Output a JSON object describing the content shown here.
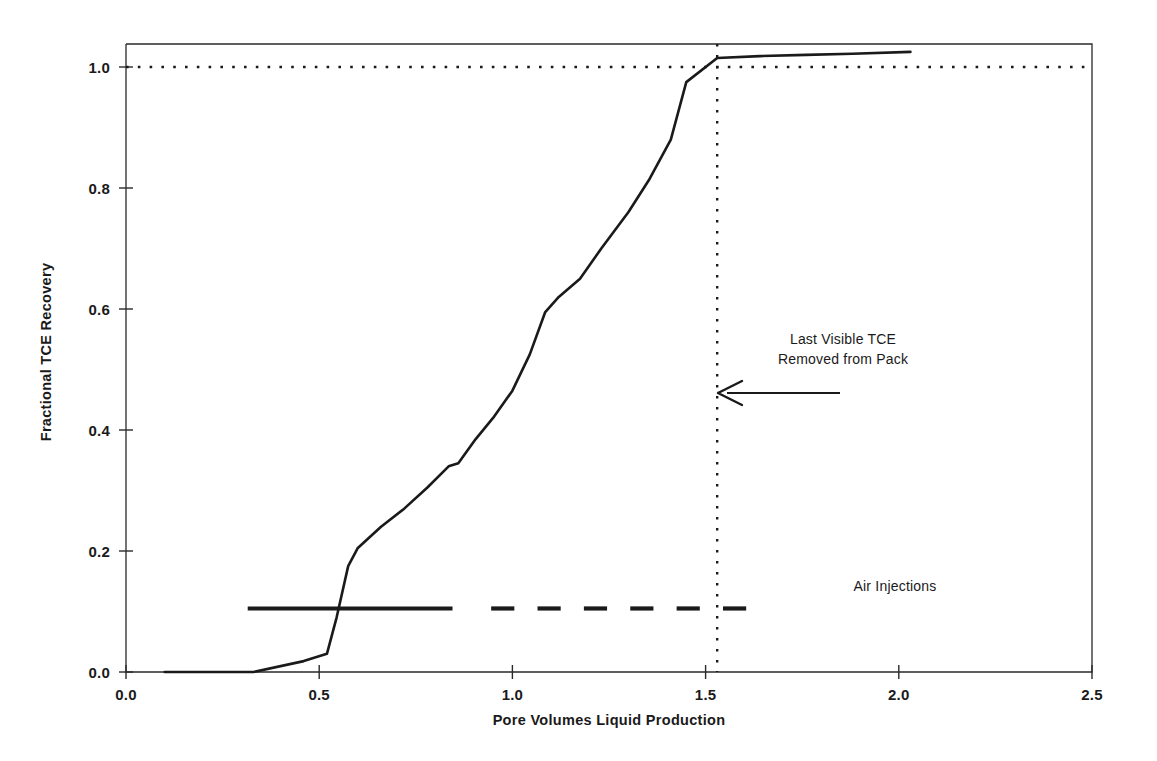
{
  "chart_data": {
    "type": "line",
    "title": "",
    "xlabel": "Pore Volumes Liquid Production",
    "ylabel": "Fractional TCE Recovery",
    "xlim": [
      0.0,
      2.5
    ],
    "ylim": [
      0.0,
      1.05
    ],
    "xticks": [
      "0.0",
      "0.5",
      "1.0",
      "1.5",
      "2.0",
      "2.5"
    ],
    "xtick_values": [
      0.0,
      0.5,
      1.0,
      1.5,
      2.0,
      2.5
    ],
    "yticks": [
      "0.0",
      "0.2",
      "0.4",
      "0.6",
      "0.8",
      "1.0"
    ],
    "ytick_values": [
      0.0,
      0.2,
      0.4,
      0.6,
      0.8,
      1.0
    ],
    "grid": false,
    "legend": "none",
    "series": [
      {
        "name": "Fractional TCE Recovery",
        "style": "solid",
        "x": [
          0.1,
          0.21,
          0.33,
          0.46,
          0.52,
          0.545,
          0.575,
          0.6,
          0.66,
          0.72,
          0.78,
          0.835,
          0.86,
          0.905,
          0.95,
          1.0,
          1.045,
          1.085,
          1.12,
          1.175,
          1.23,
          1.3,
          1.355,
          1.41,
          1.45,
          1.53,
          1.64,
          1.76,
          1.88,
          2.03
        ],
        "y": [
          0.0,
          0.0,
          0.0,
          0.018,
          0.03,
          0.09,
          0.175,
          0.205,
          0.24,
          0.27,
          0.305,
          0.34,
          0.345,
          0.385,
          0.42,
          0.465,
          0.525,
          0.595,
          0.62,
          0.65,
          0.7,
          0.76,
          0.815,
          0.88,
          0.975,
          1.015,
          1.018,
          1.02,
          1.022,
          1.025
        ]
      }
    ],
    "reference_lines": [
      {
        "name": "complete-recovery-line",
        "orientation": "horizontal",
        "value": 1.0,
        "style": "dotted"
      },
      {
        "name": "last-visible-tce-line",
        "orientation": "vertical",
        "value": 1.53,
        "style": "dotted"
      }
    ],
    "air_injection_marker": {
      "label": "Air Injections",
      "y": 0.105,
      "segments": [
        [
          0.315,
          0.845
        ],
        [
          0.945,
          1.005
        ],
        [
          1.065,
          1.125
        ],
        [
          1.185,
          1.245
        ],
        [
          1.305,
          1.365
        ],
        [
          1.425,
          1.485
        ],
        [
          1.545,
          1.605
        ]
      ]
    },
    "annotations": [
      {
        "name": "last-visible-tce-annotation",
        "lines": [
          "Last Visible TCE",
          "Removed from Pack"
        ],
        "arrow": {
          "from_x": 1.52,
          "from_y": 0.515,
          "to_x": 1.535,
          "to_y": 0.515
        }
      },
      {
        "name": "air-injections-annotation",
        "lines": [
          "Air Injections"
        ]
      }
    ],
    "colors": {
      "line": "#1a1a1a",
      "axis": "#1a1a1a",
      "background": "#ffffff",
      "text": "#1a1a1a"
    }
  },
  "axes": {
    "x_title": "Pore Volumes Liquid Production",
    "y_title": "Fractional TCE Recovery",
    "xtick_labels": [
      "0.0",
      "0.5",
      "1.0",
      "1.5",
      "2.0",
      "2.5"
    ],
    "ytick_labels": [
      "0.0",
      "0.2",
      "0.4",
      "0.6",
      "0.8",
      "1.0"
    ]
  },
  "annotations": {
    "event_line1": "Last Visible TCE",
    "event_line2": "Removed from Pack",
    "air_injections": "Air Injections"
  }
}
